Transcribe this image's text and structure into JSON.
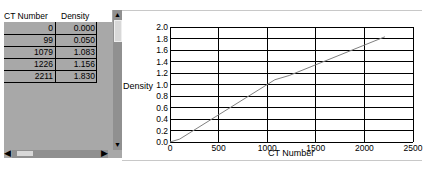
{
  "table": {
    "columns": [
      "CT Number",
      "Density"
    ],
    "rows": [
      {
        "ct": "0",
        "density": "0.000"
      },
      {
        "ct": "99",
        "density": "0.050"
      },
      {
        "ct": "1079",
        "density": "1.083"
      },
      {
        "ct": "1226",
        "density": "1.156"
      },
      {
        "ct": "2211",
        "density": "1.830"
      }
    ]
  },
  "icons": {
    "scroll_up": "▲",
    "scroll_down": "▼",
    "scroll_left": "◀",
    "scroll_right": "▶"
  },
  "chart_data": {
    "type": "line",
    "title": "",
    "xlabel": "CT Number",
    "ylabel": "Density",
    "x": [
      0,
      99,
      1079,
      1226,
      2211
    ],
    "series": [
      {
        "name": "Density",
        "values": [
          0.0,
          0.05,
          1.083,
          1.156,
          1.83
        ]
      }
    ],
    "xlim": [
      0,
      2500
    ],
    "ylim": [
      0,
      2.0
    ],
    "x_ticks": [
      "0",
      "500",
      "1000",
      "1500",
      "2000",
      "2500"
    ],
    "y_ticks": [
      "0.0",
      "0.2",
      "0.4",
      "0.6",
      "0.8",
      "1.0",
      "1.2",
      "1.4",
      "1.6",
      "1.8",
      "2.0"
    ],
    "grid": true,
    "legend": "none",
    "line_color": "#808080"
  }
}
